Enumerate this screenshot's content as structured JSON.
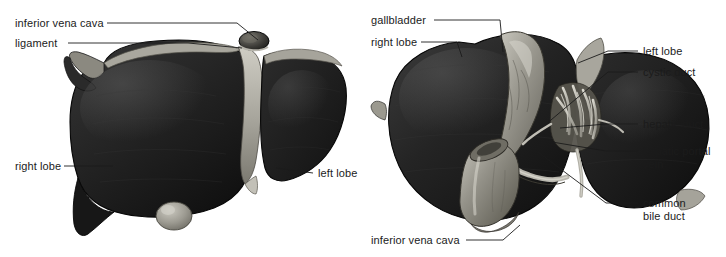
{
  "figure": {
    "background_color": "#ffffff",
    "text_color": "#1b1b1b",
    "leader_line_color": "#1b1b1b",
    "width": 726,
    "height": 257
  },
  "palette": {
    "liver_dark": "#1e1e1e",
    "liver_mid": "#2e2e2e",
    "liver_shadow": "#111111",
    "ligament_light": "#b9b7ae",
    "ligament_mid": "#8e8c83",
    "gallbladder": "#8d8b84",
    "gallbladder_light": "#adaba2",
    "vessel_light": "#c9c7be",
    "vena_cava": "#9a978e",
    "outline": "#0d0d0d"
  },
  "views": {
    "left": {
      "name": "anterior-view",
      "caption": "anterior view of liver"
    },
    "right": {
      "name": "posterior-view",
      "caption": "posterior (visceral) view of liver"
    }
  },
  "labels_left": [
    {
      "id": "inferior-vena-cava",
      "text": "inferior vena cava",
      "x": 15,
      "y": 17,
      "align": "left"
    },
    {
      "id": "ligament",
      "text": "ligament",
      "x": 15,
      "y": 37,
      "align": "left"
    },
    {
      "id": "right-lobe",
      "text": "right lobe",
      "x": 15,
      "y": 160,
      "align": "left"
    },
    {
      "id": "left-lobe",
      "text": "left lobe",
      "x": 318,
      "y": 167,
      "align": "left"
    }
  ],
  "labels_right": [
    {
      "id": "gallbladder",
      "text": "gallbladder",
      "x": 371,
      "y": 14,
      "align": "left"
    },
    {
      "id": "right-lobe",
      "text": "right lobe",
      "x": 371,
      "y": 36,
      "align": "left"
    },
    {
      "id": "left-lobe",
      "text": "left lobe",
      "x": 643,
      "y": 45,
      "align": "left"
    },
    {
      "id": "cystic-duct",
      "text": "cystic duct",
      "x": 643,
      "y": 66,
      "align": "left"
    },
    {
      "id": "hepatic-duct",
      "text": "hepatic duct",
      "x": 643,
      "y": 118,
      "align": "left"
    },
    {
      "id": "hepatic-portal-vein",
      "text": "hepatic portal\nvein",
      "x": 643,
      "y": 145,
      "align": "left"
    },
    {
      "id": "common-bile-duct",
      "text": "common\nbile duct",
      "x": 643,
      "y": 197,
      "align": "left"
    },
    {
      "id": "inferior-vena-cava",
      "text": "inferior vena cava",
      "x": 371,
      "y": 234,
      "align": "left"
    }
  ],
  "leaders_left": [
    {
      "id": "leader-inferior-vena-cava",
      "points": "107,23 237,23 258,40"
    },
    {
      "id": "leader-ligament",
      "points": "68,43 188,43 242,48"
    },
    {
      "id": "leader-right-lobe",
      "points": "64,166 113,166"
    },
    {
      "id": "leader-left-lobe",
      "points": "313,173 276,168"
    }
  ],
  "leaders_right": [
    {
      "id": "leader-gallbladder",
      "points": "434,20 500,20 503,52"
    },
    {
      "id": "leader-right-lobe",
      "points": "421,42 457,42 462,57"
    },
    {
      "id": "leader-left-lobe",
      "points": "638,51 608,51 578,63"
    },
    {
      "id": "leader-cystic-duct",
      "points": "638,72 608,72 545,125"
    },
    {
      "id": "leader-hepatic-duct",
      "points": "638,124 606,124 560,128"
    },
    {
      "id": "leader-hepatic-portal-vein",
      "points": "638,151 606,151 546,141"
    },
    {
      "id": "leader-common-bile-duct",
      "points": "638,203 606,203 538,152"
    },
    {
      "id": "leader-inferior-vena-cava",
      "points": "466,240 503,240 520,225"
    }
  ]
}
